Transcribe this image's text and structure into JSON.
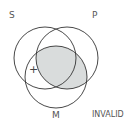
{
  "diagram": {
    "type": "venn-syllogism",
    "labels": {
      "s": "S",
      "p": "P",
      "m": "M"
    },
    "verdict": "INVALID",
    "mark": "+",
    "colors": {
      "stroke": "#333333",
      "shade": "#d9dcdc",
      "label": "#555555"
    },
    "shaded_regions": [
      "P∩M"
    ],
    "marked_region": "S∩M outside P"
  }
}
